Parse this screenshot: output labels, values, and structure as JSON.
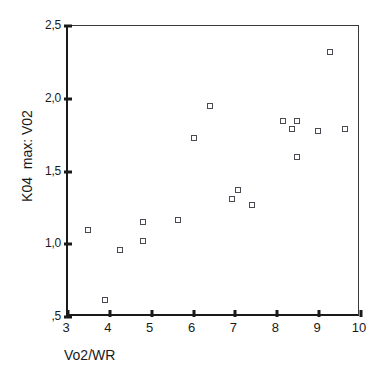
{
  "chart_data": {
    "type": "scatter",
    "title": "",
    "xlabel": "Vo2/WR",
    "ylabel": "K04  max: V02",
    "xlim": [
      3,
      10
    ],
    "ylim": [
      0.5,
      2.5
    ],
    "grid": false,
    "legend": null,
    "decimal_separator": ",",
    "marker": "open-square",
    "xticks": [
      "3",
      "4",
      "5",
      "6",
      "7",
      "8",
      "9",
      "10"
    ],
    "xtick_values": [
      3,
      4,
      5,
      6,
      7,
      8,
      9,
      10
    ],
    "yticks": [
      ",5",
      "1,0",
      "1,5",
      "2,0",
      "2,5"
    ],
    "ytick_values": [
      0.5,
      1.0,
      1.5,
      2.0,
      2.5
    ],
    "series": [
      {
        "name": "subjects",
        "points": [
          {
            "x": 3.48,
            "y": 1.1
          },
          {
            "x": 3.88,
            "y": 0.62
          },
          {
            "x": 4.25,
            "y": 0.96
          },
          {
            "x": 4.79,
            "y": 1.15
          },
          {
            "x": 4.79,
            "y": 1.02
          },
          {
            "x": 5.63,
            "y": 1.17
          },
          {
            "x": 6.01,
            "y": 1.73
          },
          {
            "x": 6.39,
            "y": 1.95
          },
          {
            "x": 6.93,
            "y": 1.31
          },
          {
            "x": 7.05,
            "y": 1.37
          },
          {
            "x": 7.4,
            "y": 1.27
          },
          {
            "x": 8.13,
            "y": 1.85
          },
          {
            "x": 8.35,
            "y": 1.79
          },
          {
            "x": 8.47,
            "y": 1.85
          },
          {
            "x": 8.47,
            "y": 1.6
          },
          {
            "x": 8.97,
            "y": 1.78
          },
          {
            "x": 9.25,
            "y": 2.32
          },
          {
            "x": 9.61,
            "y": 1.79
          }
        ]
      }
    ]
  },
  "colors": {
    "axis": "#1a1a1a",
    "marker_stroke": "#4a4a52",
    "marker_fill": "#ffffff",
    "background": "#ffffff"
  }
}
